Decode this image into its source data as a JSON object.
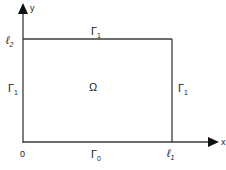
{
  "diagram": {
    "type": "rectangular-domain",
    "colors": {
      "stroke": "#3a3a3a",
      "text": "#222222",
      "background": "#ffffff"
    },
    "axes": {
      "x_label": "x",
      "y_label": "y",
      "origin_label": "0"
    },
    "ticks": {
      "x_end": {
        "base": "ℓ",
        "sub": "1"
      },
      "y_end": {
        "base": "ℓ",
        "sub": "2"
      }
    },
    "domain_label": "Ω",
    "boundaries": {
      "bottom": {
        "base": "Γ",
        "sub": "0"
      },
      "top": {
        "base": "Γ",
        "sub": "1"
      },
      "left": {
        "base": "Γ",
        "sub": "1"
      },
      "right": {
        "base": "Γ",
        "sub": "1"
      }
    }
  }
}
